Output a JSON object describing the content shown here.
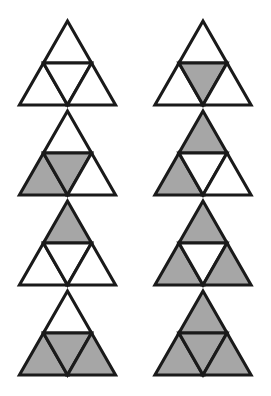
{
  "figure": {
    "columns": 2,
    "rows": 4,
    "background_color": "#ffffff",
    "shaded_color": "#a6a6a6",
    "unshaded_color": "#ffffff",
    "outline_color": "#1a1a1a",
    "outline_width": 3,
    "cell_names": [
      "top",
      "bottom_left",
      "middle_inverted",
      "bottom_right"
    ],
    "items": [
      {
        "index": 1,
        "position": "row-1-left",
        "row": 1,
        "column": 1,
        "cells": {
          "top": "white",
          "bottom_left": "white",
          "middle_inverted": "white",
          "bottom_right": "white"
        },
        "shaded_count": 0
      },
      {
        "index": 2,
        "position": "row-1-right",
        "row": 1,
        "column": 2,
        "cells": {
          "top": "white",
          "bottom_left": "white",
          "middle_inverted": "shaded",
          "bottom_right": "white"
        },
        "shaded_count": 1
      },
      {
        "index": 3,
        "position": "row-2-left",
        "row": 2,
        "column": 1,
        "cells": {
          "top": "white",
          "bottom_left": "shaded",
          "middle_inverted": "shaded",
          "bottom_right": "white"
        },
        "shaded_count": 2
      },
      {
        "index": 4,
        "position": "row-2-right",
        "row": 2,
        "column": 2,
        "cells": {
          "top": "shaded",
          "bottom_left": "shaded",
          "middle_inverted": "white",
          "bottom_right": "white"
        },
        "shaded_count": 2
      },
      {
        "index": 5,
        "position": "row-3-left",
        "row": 3,
        "column": 1,
        "cells": {
          "top": "shaded",
          "bottom_left": "white",
          "middle_inverted": "white",
          "bottom_right": "white"
        },
        "shaded_count": 1
      },
      {
        "index": 6,
        "position": "row-3-right",
        "row": 3,
        "column": 2,
        "cells": {
          "top": "shaded",
          "bottom_left": "shaded",
          "middle_inverted": "white",
          "bottom_right": "shaded"
        },
        "shaded_count": 3
      },
      {
        "index": 7,
        "position": "row-4-left",
        "row": 4,
        "column": 1,
        "cells": {
          "top": "white",
          "bottom_left": "shaded",
          "middle_inverted": "shaded",
          "bottom_right": "shaded"
        },
        "shaded_count": 3
      },
      {
        "index": 8,
        "position": "row-4-right",
        "row": 4,
        "column": 2,
        "cells": {
          "top": "shaded",
          "bottom_left": "shaded",
          "middle_inverted": "shaded",
          "bottom_right": "shaded"
        },
        "shaded_count": 4
      }
    ]
  }
}
